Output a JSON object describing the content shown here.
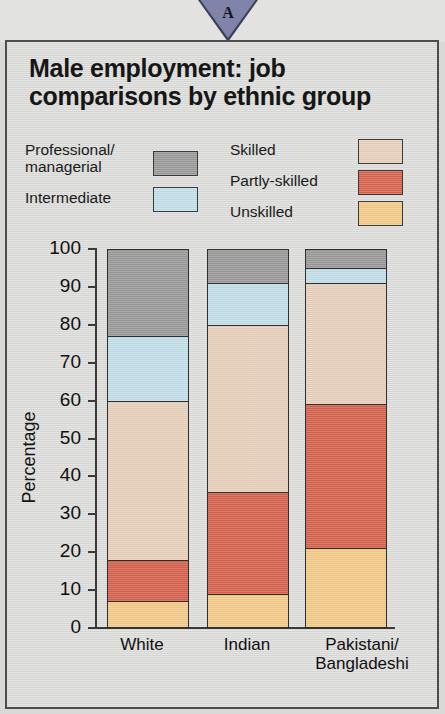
{
  "marker": {
    "letter": "A",
    "shape": "triangle-down-icon",
    "color": "#8084ab"
  },
  "chart_title": "Male employment: job comparisons by ethnic group",
  "legend": {
    "left": [
      {
        "label": "Professional/\nmanagerial",
        "color": "#9a9a9a",
        "key": "professional"
      },
      {
        "label": "Intermediate",
        "color": "#c2e0ea",
        "key": "intermediate"
      }
    ],
    "right": [
      {
        "label": "Skilled",
        "color": "#e8d0bc",
        "key": "skilled"
      },
      {
        "label": "Partly-skilled",
        "color": "#d7624d",
        "key": "partly_skilled"
      },
      {
        "label": "Unskilled",
        "color": "#f4cb89",
        "key": "unskilled"
      }
    ]
  },
  "chart_data": {
    "type": "bar",
    "subtype": "stacked-bar-100",
    "title": "Male employment: job comparisons by ethnic group",
    "xlabel": "",
    "ylabel": "Percentage",
    "ylim": [
      0,
      100
    ],
    "yticks": [
      0,
      10,
      20,
      30,
      40,
      50,
      60,
      70,
      80,
      90,
      100
    ],
    "ytick_labels": [
      "0",
      "10",
      "20",
      "30",
      "40",
      "50",
      "60",
      "70",
      "80",
      "90",
      "100"
    ],
    "grid": false,
    "legend_position": "top",
    "categories": [
      "White",
      "Indian",
      "Pakistani/\nBangladeshi"
    ],
    "stack_order_bottom_to_top": [
      "Unskilled",
      "Partly-skilled",
      "Skilled",
      "Intermediate",
      "Professional/managerial"
    ],
    "series": [
      {
        "name": "Unskilled",
        "color": "#f4cb89",
        "values": [
          7,
          9,
          21
        ]
      },
      {
        "name": "Partly-skilled",
        "color": "#d7624d",
        "values": [
          11,
          27,
          38
        ]
      },
      {
        "name": "Skilled",
        "color": "#e8d0bc",
        "values": [
          42,
          44,
          32
        ]
      },
      {
        "name": "Intermediate",
        "color": "#c2e0ea",
        "values": [
          17,
          11,
          4
        ]
      },
      {
        "name": "Professional/managerial",
        "color": "#9a9a9a",
        "values": [
          23,
          9,
          5
        ]
      }
    ],
    "cumulative_tops": [
      [
        7,
        18,
        60,
        77,
        100
      ],
      [
        9,
        36,
        80,
        91,
        100
      ],
      [
        21,
        59,
        91,
        95,
        100
      ]
    ]
  }
}
